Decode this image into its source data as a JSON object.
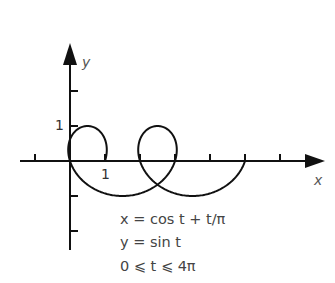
{
  "chart_data": {
    "type": "line",
    "title": "",
    "xlabel": "x",
    "ylabel": "y",
    "parametric": {
      "x_expr": "cos t + t/π",
      "y_expr": "sin t",
      "t_range": [
        0,
        12.566370614359172
      ]
    },
    "tick_labels": {
      "x": [
        "1"
      ],
      "y": [
        "1"
      ]
    },
    "x_ticks": [
      -1,
      1,
      2,
      3,
      4,
      5,
      6
    ],
    "y_ticks": [
      -2,
      -1,
      1,
      2
    ],
    "xlim": [
      -1.9,
      7.3
    ],
    "ylim": [
      -2.6,
      3.2
    ],
    "grid": false,
    "key_points": [
      {
        "t": 0,
        "x": 1,
        "y": 0
      },
      {
        "t": 1.5708,
        "x": 0.5,
        "y": 1
      },
      {
        "t": 3.1416,
        "x": 0,
        "y": -0.0
      },
      {
        "t": 4.7124,
        "x": 1.5,
        "y": -1
      },
      {
        "t": 7.854,
        "x": 2.5,
        "y": 1
      },
      {
        "t": 10.9956,
        "x": 3.5,
        "y": -1
      },
      {
        "t": 12.5664,
        "x": 5,
        "y": 0
      }
    ]
  },
  "axes": {
    "x_label": "x",
    "y_label": "y",
    "x_tick_label": "1",
    "y_tick_label": "1"
  },
  "equations": {
    "line1": "x = cos t + t/π",
    "line2": "y = sin t",
    "line3": "0 ⩽ t ⩽ 4π"
  },
  "colors": {
    "ink": "#111111",
    "text": "#444444",
    "background": "#ffffff"
  }
}
